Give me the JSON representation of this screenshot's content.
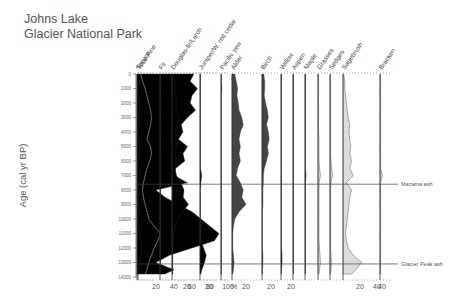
{
  "title_line1": "Johns Lake",
  "title_line2": "Glacier National Park",
  "chart_data": {
    "type": "area",
    "ylabel": "Age (cal yr BP)",
    "ylim": [
      0,
      14000
    ],
    "y_ticks": [
      0,
      1000,
      2000,
      3000,
      4000,
      5000,
      6000,
      7000,
      8000,
      9000,
      10000,
      11000,
      12000,
      13000,
      14000
    ],
    "x_unit": "%",
    "markers": [
      {
        "label": "Mazama ash",
        "age": 7600
      },
      {
        "label": "Glacier Peak ash",
        "age": 13100
      }
    ],
    "annotations": [
      "P.contorta type",
      "Pinus undiff.",
      "P.monticola type"
    ],
    "ages": [
      0,
      500,
      1000,
      1500,
      2000,
      2500,
      3000,
      3500,
      4000,
      4500,
      5000,
      5500,
      6000,
      6500,
      7000,
      7500,
      8000,
      8500,
      9000,
      9500,
      10000,
      10500,
      11000,
      11500,
      12000,
      12500,
      13000,
      13500,
      13800
    ],
    "series": [
      {
        "name": "Total Pine",
        "xlim": [
          0,
          100
        ],
        "x_ticks": [
          20,
          40,
          60,
          80,
          100
        ],
        "color": "#000000",
        "values": [
          62,
          58,
          66,
          60,
          58,
          64,
          55,
          48,
          50,
          45,
          55,
          50,
          52,
          42,
          40,
          55,
          20,
          30,
          45,
          60,
          70,
          80,
          90,
          85,
          60,
          35,
          20,
          40,
          30
        ]
      },
      {
        "name": "P.contorta type",
        "xlim": [
          0,
          100
        ],
        "color": "#888888",
        "line": true,
        "values": [
          3,
          5,
          8,
          10,
          12,
          14,
          15,
          14,
          12,
          10,
          14,
          15,
          13,
          10,
          8,
          6,
          5,
          6,
          8,
          10,
          12,
          18,
          25,
          22,
          18,
          15,
          12,
          10,
          8
        ]
      },
      {
        "name": "Spruce",
        "xlim": [
          0,
          20
        ],
        "color": "#000000",
        "values": [
          2,
          3,
          2,
          2,
          2,
          3,
          2,
          2,
          2,
          2,
          3,
          2,
          2,
          2,
          4,
          2,
          2,
          2,
          2,
          2,
          2,
          2,
          3,
          4,
          5,
          4,
          3,
          2,
          2
        ]
      },
      {
        "name": "Fir",
        "xlim": [
          0,
          20
        ],
        "color": "#000000",
        "values": [
          1,
          2,
          1,
          1,
          2,
          1,
          1,
          2,
          1,
          1,
          1,
          1,
          2,
          1,
          2,
          1,
          1,
          1,
          1,
          1,
          1,
          1,
          1,
          1,
          1,
          1,
          1,
          1,
          1
        ]
      },
      {
        "name": "Douglas-fir/Larch",
        "xlim": [
          0,
          40
        ],
        "x_ticks": [
          20
        ],
        "color": "#000000",
        "values": [
          3,
          4,
          3,
          5,
          6,
          5,
          10,
          6,
          4,
          5,
          6,
          4,
          5,
          4,
          6,
          12,
          16,
          15,
          22,
          14,
          8,
          4,
          2,
          1,
          1,
          1,
          1,
          1,
          1
        ]
      },
      {
        "name": "Juniper/W. red cedar",
        "xlim": [
          0,
          40
        ],
        "x_ticks": [
          20
        ],
        "color": "#000000",
        "values": [
          1,
          1,
          1,
          1,
          1,
          1,
          1,
          1,
          1,
          1,
          1,
          1,
          1,
          1,
          4,
          2,
          1,
          1,
          1,
          1,
          1,
          1,
          1,
          2,
          8,
          14,
          10,
          4,
          2
        ]
      },
      {
        "name": "Pacific yew",
        "xlim": [
          0,
          20
        ],
        "color": "#000000",
        "values": [
          1,
          1,
          2,
          1,
          1,
          1,
          1,
          1,
          1,
          1,
          1,
          1,
          1,
          1,
          1,
          1,
          1,
          1,
          1,
          1,
          1,
          1,
          1,
          1,
          1,
          1,
          1,
          1,
          1
        ]
      },
      {
        "name": "Alder",
        "xlim": [
          0,
          40
        ],
        "x_ticks": [
          20
        ],
        "color": "#444444",
        "values": [
          4,
          6,
          8,
          7,
          9,
          10,
          14,
          16,
          12,
          10,
          12,
          10,
          12,
          8,
          6,
          12,
          16,
          14,
          20,
          10,
          4,
          2,
          1,
          1,
          1,
          2,
          3,
          2,
          1
        ]
      },
      {
        "name": "Birch",
        "xlim": [
          0,
          40
        ],
        "x_ticks": [
          20
        ],
        "color": "#444444",
        "values": [
          4,
          6,
          6,
          5,
          8,
          12,
          14,
          10,
          14,
          16,
          12,
          14,
          10,
          5,
          3,
          3,
          2,
          2,
          2,
          1,
          1,
          1,
          1,
          1,
          1,
          2,
          2,
          1,
          1
        ]
      },
      {
        "name": "Willow",
        "xlim": [
          0,
          20
        ],
        "x_ticks": [
          20
        ],
        "color": "#000000",
        "values": [
          1,
          1,
          1,
          1,
          1,
          1,
          1,
          1,
          1,
          1,
          1,
          1,
          1,
          1,
          1,
          1,
          1,
          1,
          1,
          1,
          1,
          1,
          1,
          1,
          1,
          2,
          2,
          1,
          1
        ]
      },
      {
        "name": "Aspen",
        "xlim": [
          0,
          20
        ],
        "color": "#000000",
        "values": [
          1,
          1,
          1,
          1,
          1,
          1,
          1,
          1,
          1,
          1,
          1,
          1,
          1,
          1,
          1,
          1,
          1,
          1,
          1,
          1,
          1,
          1,
          1,
          1,
          1,
          1,
          1,
          1,
          1
        ]
      },
      {
        "name": "Maple",
        "xlim": [
          0,
          20
        ],
        "color": "#000000",
        "values": [
          1,
          1,
          1,
          1,
          1,
          1,
          1,
          1,
          1,
          1,
          1,
          1,
          1,
          1,
          2,
          1,
          1,
          1,
          1,
          1,
          1,
          1,
          1,
          1,
          1,
          1,
          1,
          1,
          1
        ]
      },
      {
        "name": "Grasses",
        "xlim": [
          0,
          20
        ],
        "color": "#dddddd",
        "values": [
          1,
          1,
          1,
          1,
          1,
          1,
          1,
          1,
          1,
          2,
          2,
          2,
          2,
          3,
          5,
          2,
          2,
          2,
          2,
          2,
          2,
          2,
          2,
          2,
          3,
          4,
          5,
          3,
          2
        ]
      },
      {
        "name": "Sedges",
        "xlim": [
          0,
          20
        ],
        "color": "#dddddd",
        "values": [
          1,
          1,
          1,
          1,
          1,
          1,
          1,
          1,
          1,
          1,
          1,
          1,
          2,
          3,
          5,
          2,
          1,
          1,
          1,
          1,
          1,
          1,
          1,
          1,
          1,
          2,
          3,
          2,
          1
        ]
      },
      {
        "name": "Sagebrush",
        "xlim": [
          0,
          40
        ],
        "x_ticks": [
          20,
          40
        ],
        "color": "#dddddd",
        "values": [
          1,
          2,
          2,
          3,
          4,
          5,
          6,
          8,
          7,
          8,
          9,
          8,
          10,
          8,
          12,
          4,
          10,
          8,
          7,
          6,
          5,
          4,
          3,
          4,
          6,
          12,
          22,
          15,
          10
        ]
      },
      {
        "name": "Bracken",
        "xlim": [
          0,
          20
        ],
        "x_ticks": [
          40
        ],
        "color": "#dddddd",
        "values": [
          1,
          1,
          1,
          1,
          1,
          1,
          1,
          1,
          1,
          1,
          1,
          1,
          1,
          1,
          4,
          1,
          1,
          1,
          1,
          1,
          1,
          1,
          1,
          1,
          1,
          1,
          1,
          1,
          1
        ]
      }
    ]
  },
  "layout": {
    "y0": 74,
    "y1": 277,
    "columns": [
      {
        "x": 138,
        "w": 90
      },
      {
        "x": 138,
        "w": 90
      },
      {
        "x": 137,
        "w": 18
      },
      {
        "x": 160,
        "w": 12
      },
      {
        "x": 172,
        "w": 30
      },
      {
        "x": 200,
        "w": 18
      },
      {
        "x": 221,
        "w": 8
      },
      {
        "x": 232,
        "w": 28
      },
      {
        "x": 262,
        "w": 18
      },
      {
        "x": 281,
        "w": 10
      },
      {
        "x": 293,
        "w": 10
      },
      {
        "x": 305,
        "w": 10
      },
      {
        "x": 318,
        "w": 10
      },
      {
        "x": 330,
        "w": 10
      },
      {
        "x": 343,
        "w": 34
      },
      {
        "x": 380,
        "w": 12
      }
    ]
  }
}
